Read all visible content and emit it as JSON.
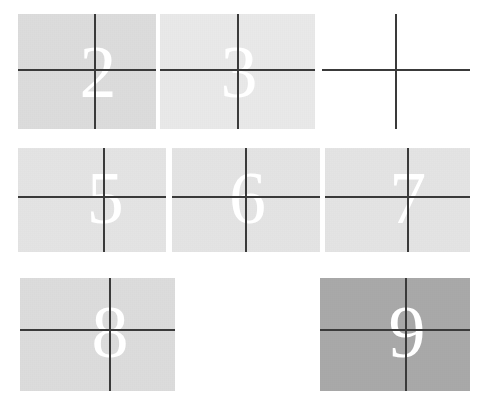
{
  "figure": {
    "kind": "scanned-grid-of-numbered-gray-patches",
    "background_color": "#ffffff",
    "width": 486,
    "height": 407,
    "line_color": "#3a3a3a",
    "numeral_color": "#ffffff"
  },
  "grid": {
    "rows": 3,
    "columns": 3,
    "cells": [
      {
        "label": "2",
        "visible": true,
        "blank": false,
        "empty": false,
        "fill": "#dcdcdc",
        "x": 18,
        "y": 14,
        "w": 138,
        "h": 115,
        "cross_x_pct": 56,
        "cross_y_pct": 49,
        "num_x_pct": 58,
        "num_y_pct": 50
      },
      {
        "label": "3",
        "visible": true,
        "blank": false,
        "empty": false,
        "fill": "#e9e9e9",
        "x": 160,
        "y": 14,
        "w": 155,
        "h": 115,
        "cross_x_pct": 50,
        "cross_y_pct": 49,
        "num_x_pct": 51,
        "num_y_pct": 50
      },
      {
        "label": "4",
        "visible": true,
        "blank": true,
        "empty": false,
        "fill": "#ffffff",
        "x": 322,
        "y": 14,
        "w": 148,
        "h": 115,
        "cross_x_pct": 50,
        "cross_y_pct": 49,
        "num_x_pct": 51,
        "num_y_pct": 50
      },
      {
        "label": "5",
        "visible": true,
        "blank": false,
        "empty": false,
        "fill": "#e4e4e4",
        "x": 18,
        "y": 148,
        "w": 148,
        "h": 104,
        "cross_x_pct": 58,
        "cross_y_pct": 47,
        "num_x_pct": 59,
        "num_y_pct": 48
      },
      {
        "label": "6",
        "visible": true,
        "blank": false,
        "empty": false,
        "fill": "#e4e4e4",
        "x": 172,
        "y": 148,
        "w": 148,
        "h": 104,
        "cross_x_pct": 50,
        "cross_y_pct": 47,
        "num_x_pct": 51,
        "num_y_pct": 48
      },
      {
        "label": "7",
        "visible": true,
        "blank": false,
        "empty": false,
        "fill": "#e4e4e4",
        "x": 325,
        "y": 148,
        "w": 145,
        "h": 104,
        "cross_x_pct": 57,
        "cross_y_pct": 47,
        "num_x_pct": 57,
        "num_y_pct": 48
      },
      {
        "label": "8",
        "visible": true,
        "blank": false,
        "empty": false,
        "fill": "#dcdcdc",
        "x": 20,
        "y": 278,
        "w": 155,
        "h": 113,
        "cross_x_pct": 58,
        "cross_y_pct": 46,
        "num_x_pct": 58,
        "num_y_pct": 48
      },
      {
        "label": "",
        "visible": false,
        "blank": false,
        "empty": true,
        "fill": "#ffffff",
        "x": 186,
        "y": 278,
        "w": 140,
        "h": 113,
        "cross_x_pct": 50,
        "cross_y_pct": 46,
        "num_x_pct": 50,
        "num_y_pct": 48
      },
      {
        "label": "9",
        "visible": true,
        "blank": false,
        "empty": false,
        "fill": "#a9a9a9",
        "x": 320,
        "y": 278,
        "w": 150,
        "h": 113,
        "cross_x_pct": 57,
        "cross_y_pct": 46,
        "num_x_pct": 58,
        "num_y_pct": 48
      }
    ]
  }
}
